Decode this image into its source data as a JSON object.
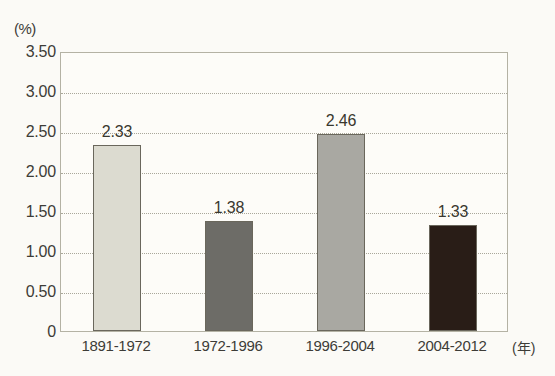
{
  "chart_data": {
    "type": "bar",
    "title": "",
    "subtitle": "",
    "xlabel": "(年)",
    "ylabel": "(%)",
    "categories": [
      "1891-1972",
      "1972-1996",
      "1996-2004",
      "2004-2012"
    ],
    "values": [
      2.33,
      1.38,
      2.46,
      1.33
    ],
    "value_labels": [
      "2.33",
      "1.38",
      "2.46",
      "1.33"
    ],
    "series": [
      {
        "name": "",
        "values": [
          2.33,
          1.38,
          2.46,
          1.33
        ]
      }
    ],
    "bar_colors": [
      "#dcdbd0",
      "#6d6c67",
      "#a9a8a2",
      "#291d17"
    ],
    "ylim": [
      0,
      3.5
    ],
    "ytick_values": [
      0,
      0.5,
      1.0,
      1.5,
      2.0,
      2.5,
      3.0,
      3.5
    ],
    "ytick_labels": [
      "0",
      "0.50",
      "1.00",
      "1.50",
      "2.00",
      "2.50",
      "3.00",
      "3.50"
    ],
    "grid": "horizontal-dotted",
    "legend": "none",
    "legend_position": "none"
  },
  "axes": {
    "y_unit_label": "(%)",
    "x_unit_label": "(年)"
  },
  "colors": {
    "background": "#fbfaf6",
    "plot_background": "#fdfcf8",
    "frame": "#b4b2a4",
    "gridline": "#a9a79a",
    "text": "#3d3c37",
    "bar_outline": "#6a675c"
  }
}
